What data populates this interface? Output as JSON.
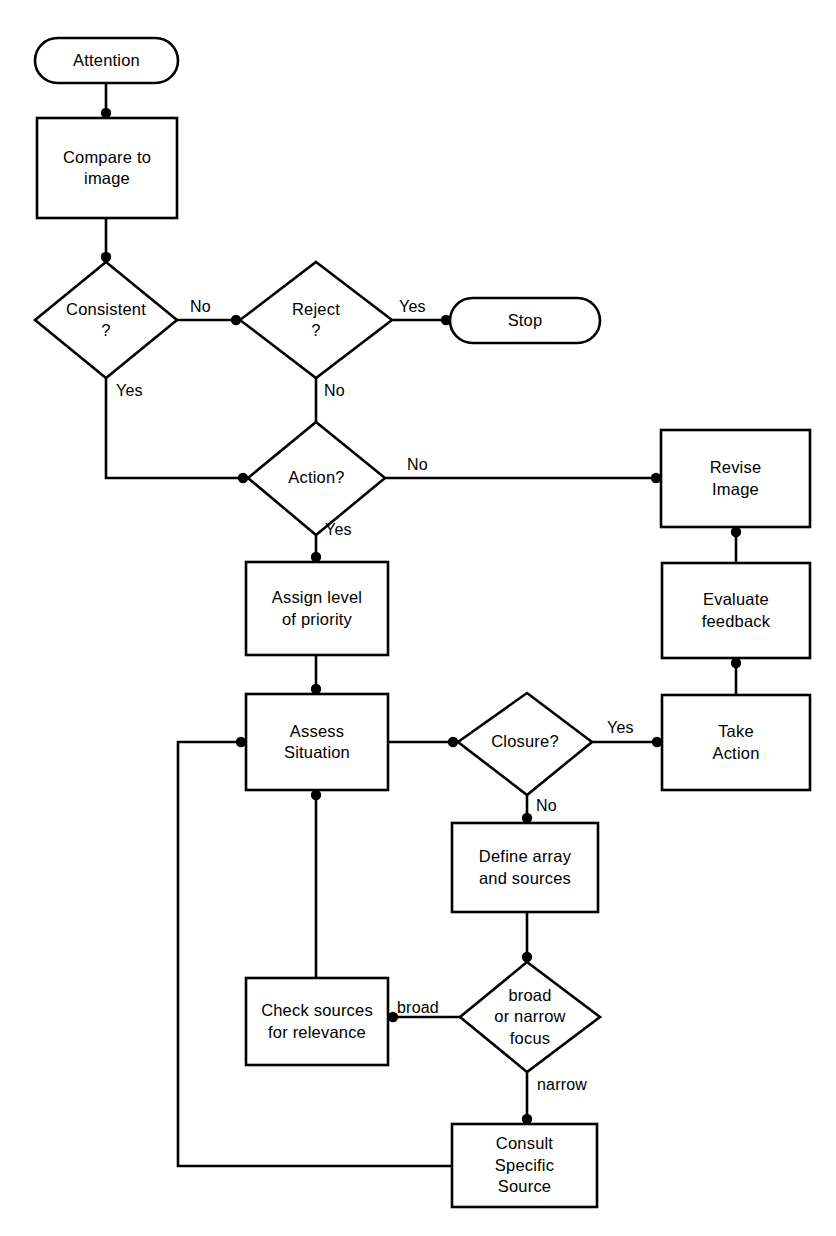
{
  "diagram": {
    "type": "flowchart",
    "title": "",
    "background_color": "#ffffff",
    "line_color": "#000000",
    "nodes": [
      {
        "id": "attention",
        "shape": "terminator",
        "label": "Attention"
      },
      {
        "id": "compare",
        "shape": "process",
        "label": "Compare to\nimage"
      },
      {
        "id": "consistent",
        "shape": "decision",
        "label": "Consistent\n?"
      },
      {
        "id": "reject",
        "shape": "decision",
        "label": "Reject\n?"
      },
      {
        "id": "stop",
        "shape": "terminator",
        "label": "Stop"
      },
      {
        "id": "action",
        "shape": "decision",
        "label": "Action?"
      },
      {
        "id": "revise",
        "shape": "process",
        "label": "Revise\nImage"
      },
      {
        "id": "assign",
        "shape": "process",
        "label": "Assign level\nof priority"
      },
      {
        "id": "evaluate",
        "shape": "process",
        "label": "Evaluate\nfeedback"
      },
      {
        "id": "assess",
        "shape": "process",
        "label": "Assess\nSituation"
      },
      {
        "id": "closure",
        "shape": "decision",
        "label": "Closure?"
      },
      {
        "id": "take_action",
        "shape": "process",
        "label": "Take\nAction"
      },
      {
        "id": "define",
        "shape": "process",
        "label": "Define array\nand sources"
      },
      {
        "id": "check",
        "shape": "process",
        "label": "Check sources\nfor relevance"
      },
      {
        "id": "focus",
        "shape": "decision",
        "label": "broad\nor narrow\nfocus"
      },
      {
        "id": "consult",
        "shape": "process",
        "label": "Consult\nSpecific\nSource"
      }
    ],
    "edge_labels": [
      {
        "id": "consistent_no",
        "label": "No",
        "from": "consistent",
        "to": "reject"
      },
      {
        "id": "consistent_yes",
        "label": "Yes",
        "from": "consistent",
        "to": "action"
      },
      {
        "id": "reject_yes",
        "label": "Yes",
        "from": "reject",
        "to": "stop"
      },
      {
        "id": "reject_no",
        "label": "No",
        "from": "reject",
        "to": "action"
      },
      {
        "id": "action_no",
        "label": "No",
        "from": "action",
        "to": "revise"
      },
      {
        "id": "action_yes",
        "label": "Yes",
        "from": "action",
        "to": "assign"
      },
      {
        "id": "closure_yes",
        "label": "Yes",
        "from": "closure",
        "to": "take_action"
      },
      {
        "id": "closure_no",
        "label": "No",
        "from": "closure",
        "to": "define"
      },
      {
        "id": "focus_broad",
        "label": "broad",
        "from": "focus",
        "to": "check"
      },
      {
        "id": "focus_narrow",
        "label": "narrow",
        "from": "focus",
        "to": "consult"
      }
    ]
  }
}
